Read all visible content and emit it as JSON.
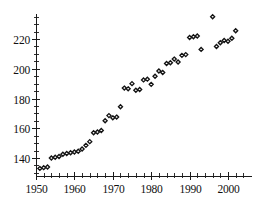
{
  "chart_data": {
    "type": "scatter",
    "title": "",
    "subtitle": "",
    "xlabel": "",
    "ylabel": "",
    "xlim": [
      1949,
      2004
    ],
    "ylim": [
      130,
      238
    ],
    "grid": false,
    "legend": null,
    "marker": "open-diamond",
    "x_ticks": [
      1950,
      1960,
      1970,
      1980,
      1990,
      2000
    ],
    "x_tick_labels": [
      "1950",
      "1960",
      "1970",
      "1980",
      "1990",
      "2000"
    ],
    "x_minor_step": 2,
    "y_ticks": [
      140,
      160,
      180,
      200,
      220
    ],
    "y_tick_labels": [
      "140",
      "160",
      "180",
      "200",
      "220"
    ],
    "y_minor_step": 5,
    "x": [
      1951,
      1952,
      1953,
      1954,
      1955,
      1956,
      1957,
      1958,
      1959,
      1960,
      1961,
      1962,
      1963,
      1964,
      1965,
      1966,
      1967,
      1968,
      1969,
      1970,
      1971,
      1972,
      1973,
      1974,
      1975,
      1976,
      1977,
      1978,
      1979,
      1980,
      1981,
      1982,
      1983,
      1984,
      1985,
      1986,
      1987,
      1988,
      1989,
      1990,
      1991,
      1992,
      1993,
      1996,
      1997,
      1998,
      1999,
      2000,
      2001,
      2002
    ],
    "y": [
      133,
      133.5,
      134,
      140,
      140.5,
      141,
      142.5,
      143,
      143.5,
      144,
      144.5,
      146,
      148.5,
      151,
      157,
      157.5,
      158.5,
      165,
      168.5,
      167,
      167.5,
      174.5,
      187,
      186.5,
      190,
      185.5,
      186,
      192.5,
      193,
      189.5,
      195,
      198.5,
      197.5,
      203.5,
      204,
      206.5,
      204.5,
      209,
      209.5,
      221,
      221.5,
      222,
      213,
      235,
      215,
      217.5,
      219,
      218.5,
      220.5,
      225.5
    ],
    "points": [
      {
        "x": 1951,
        "y": 133
      },
      {
        "x": 1952,
        "y": 133.5
      },
      {
        "x": 1953,
        "y": 134
      },
      {
        "x": 1954,
        "y": 140
      },
      {
        "x": 1955,
        "y": 140.5
      },
      {
        "x": 1956,
        "y": 141
      },
      {
        "x": 1957,
        "y": 142.5
      },
      {
        "x": 1958,
        "y": 143
      },
      {
        "x": 1959,
        "y": 143.5
      },
      {
        "x": 1960,
        "y": 144
      },
      {
        "x": 1961,
        "y": 144.5
      },
      {
        "x": 1962,
        "y": 146
      },
      {
        "x": 1963,
        "y": 148.5
      },
      {
        "x": 1964,
        "y": 151
      },
      {
        "x": 1965,
        "y": 157
      },
      {
        "x": 1966,
        "y": 157.5
      },
      {
        "x": 1967,
        "y": 158.5
      },
      {
        "x": 1968,
        "y": 165
      },
      {
        "x": 1969,
        "y": 168.5
      },
      {
        "x": 1970,
        "y": 167
      },
      {
        "x": 1971,
        "y": 167.5
      },
      {
        "x": 1972,
        "y": 174.5
      },
      {
        "x": 1973,
        "y": 187
      },
      {
        "x": 1974,
        "y": 186.5
      },
      {
        "x": 1975,
        "y": 190
      },
      {
        "x": 1976,
        "y": 185.5
      },
      {
        "x": 1977,
        "y": 186
      },
      {
        "x": 1978,
        "y": 192.5
      },
      {
        "x": 1979,
        "y": 193
      },
      {
        "x": 1980,
        "y": 189.5
      },
      {
        "x": 1981,
        "y": 195
      },
      {
        "x": 1982,
        "y": 198.5
      },
      {
        "x": 1983,
        "y": 197.5
      },
      {
        "x": 1984,
        "y": 203.5
      },
      {
        "x": 1985,
        "y": 204
      },
      {
        "x": 1986,
        "y": 206.5
      },
      {
        "x": 1987,
        "y": 204.5
      },
      {
        "x": 1988,
        "y": 209
      },
      {
        "x": 1989,
        "y": 209.5
      },
      {
        "x": 1990,
        "y": 221
      },
      {
        "x": 1991,
        "y": 221.5
      },
      {
        "x": 1992,
        "y": 222
      },
      {
        "x": 1993,
        "y": 213
      },
      {
        "x": 1996,
        "y": 235
      },
      {
        "x": 1997,
        "y": 215
      },
      {
        "x": 1998,
        "y": 217.5
      },
      {
        "x": 1999,
        "y": 219
      },
      {
        "x": 2000,
        "y": 218.5
      },
      {
        "x": 2001,
        "y": 220.5
      },
      {
        "x": 2002,
        "y": 225.5
      }
    ]
  },
  "style": {
    "marker_fill": "#ffffff",
    "marker_stroke": "#121212",
    "axis_color": "#1a1a1a",
    "text_color": "#101010",
    "background": "#ffffff"
  },
  "geometry": {
    "plot_left": 36,
    "plot_right": 248,
    "plot_top": 14,
    "plot_bottom": 176
  }
}
